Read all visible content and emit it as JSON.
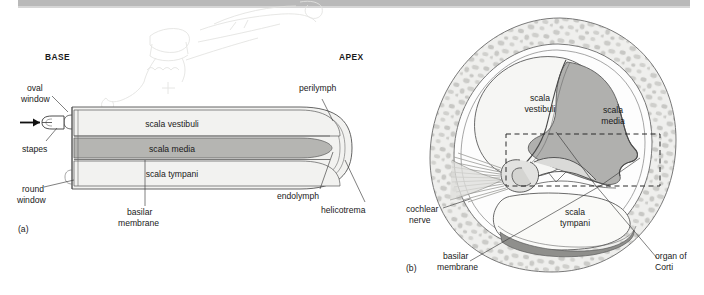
{
  "figure": {
    "background_color": "#ffffff",
    "scan_edge_bar_color": "#b9b9b9"
  },
  "colors": {
    "perilymph_fill": "#f2f2f0",
    "scala_media_fill": "#b5b5b2",
    "scala_media_fill_b": "#b0b0ae",
    "bone_fill": "#ececea",
    "bone_speckle": "#c9c9c6",
    "outline": "#4a4a4a",
    "leader_line": "#3a3a3a",
    "text": "#1a1a1a",
    "ghost_artifact": "#e6e6e4"
  },
  "panel_a": {
    "tag": "(a)",
    "orientation_labels": {
      "base": "BASE",
      "apex": "APEX"
    },
    "labels": [
      {
        "id": "oval-window",
        "text": "oval\nwindow",
        "line1": "oval",
        "line2": "window"
      },
      {
        "id": "stapes",
        "text": "stapes",
        "line1": "stapes",
        "line2": ""
      },
      {
        "id": "round-window",
        "text": "round\nwindow",
        "line1": "round",
        "line2": "window"
      },
      {
        "id": "basilar-membrane",
        "text": "basilar\nmembrane",
        "line1": "basilar",
        "line2": "membrane"
      },
      {
        "id": "perilymph",
        "text": "perilymph",
        "line1": "perilymph",
        "line2": ""
      },
      {
        "id": "endolymph",
        "text": "endolymph",
        "line1": "endolymph",
        "line2": ""
      },
      {
        "id": "helicotrema",
        "text": "helicotrema",
        "line1": "helicotrema",
        "line2": ""
      }
    ],
    "chambers": [
      {
        "id": "scala-vestibuli",
        "text": "scala vestibuli",
        "fluid": "perilymph"
      },
      {
        "id": "scala-media",
        "text": "scala media",
        "fluid": "endolymph"
      },
      {
        "id": "scala-tympani",
        "text": "scala tympani",
        "fluid": "perilymph"
      }
    ],
    "sound_arrow": {
      "id": "sound-input-arrow",
      "direction": "right"
    }
  },
  "panel_b": {
    "tag": "(b)",
    "chambers": [
      {
        "id": "scala-vestibuli",
        "line1": "scala",
        "line2": "vestibuli"
      },
      {
        "id": "scala-media",
        "line1": "scala",
        "line2": "media"
      },
      {
        "id": "scala-tympani",
        "line1": "scala",
        "line2": "tympani"
      }
    ],
    "labels": [
      {
        "id": "cochlear-nerve",
        "line1": "cochlear",
        "line2": "nerve"
      },
      {
        "id": "basilar-membrane",
        "line1": "basilar",
        "line2": "membrane"
      },
      {
        "id": "organ-of-corti",
        "line1": "organ of",
        "line2": "Corti"
      }
    ],
    "callout_box": {
      "id": "organ-of-corti-detail-box",
      "style": "dashed"
    }
  }
}
